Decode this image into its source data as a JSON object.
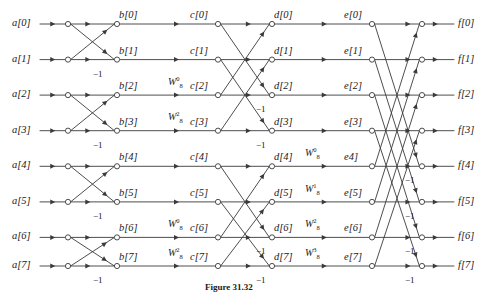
{
  "figure": {
    "caption": "Figure 31.32",
    "node_radius": 2.6,
    "colors": {
      "line": "#3a3a3a",
      "node_stroke": "#3a3a3a",
      "node_fill": "#ffffff",
      "text": "#1a1a1a",
      "background": "#ffffff"
    }
  },
  "columns": [
    {
      "key": "a",
      "x": 40,
      "label_x": 10,
      "kind": "input"
    },
    {
      "key": "n1",
      "x": 68,
      "label_x": null,
      "kind": "node"
    },
    {
      "key": "b",
      "x": 117,
      "label_x": 120,
      "kind": "node"
    },
    {
      "key": "c",
      "x": 218,
      "label_x": 190,
      "kind": "node"
    },
    {
      "key": "d",
      "x": 272,
      "label_x": 275,
      "kind": "node"
    },
    {
      "key": "e",
      "x": 372,
      "label_x": 344,
      "kind": "node"
    },
    {
      "key": "f",
      "x": 422,
      "label_x": 453,
      "kind": "output"
    }
  ],
  "rows": {
    "count": 8,
    "y": [
      24,
      59.6,
      95.1,
      130.7,
      166.3,
      201.9,
      237.4,
      266.0
    ]
  },
  "labels": {
    "a": [
      "a[0]",
      "a[1]",
      "a[2]",
      "a[3]",
      "a[4]",
      "a[5]",
      "a[6]",
      "a[7]"
    ],
    "b": [
      "b[0]",
      "b[1]",
      "b[2]",
      "b[3]",
      "b[4]",
      "b[5]",
      "b[6]",
      "b[7]"
    ],
    "c": [
      "c[0]",
      "c[1]",
      "c[2]",
      "c[3]",
      "c[4]",
      "c[5]",
      "c[6]",
      "c[7]"
    ],
    "d": [
      "d[0]",
      "d[1]",
      "d[2]",
      "d[3]",
      "d[4]",
      "d[5]",
      "d[6]",
      "d[7]"
    ],
    "e": [
      "e[0]",
      "e[1]",
      "e[2]",
      "e[3]",
      "e4]",
      "e[5]",
      "e[6]",
      "e[7]"
    ],
    "f": [
      "f[0]",
      "f[1]",
      "f[2]",
      "f[3]",
      "f[4]",
      "f[5]",
      "f[6]",
      "f[7]"
    ]
  },
  "minus_one_symbol": "−1",
  "minus_one_markers": [
    {
      "stage": "a-b",
      "row": 1,
      "x": 93,
      "y": 70
    },
    {
      "stage": "a-b",
      "row": 3,
      "x": 93,
      "y": 141
    },
    {
      "stage": "a-b",
      "row": 5,
      "x": 93,
      "y": 212
    },
    {
      "stage": "a-b",
      "row": 7,
      "x": 93,
      "y": 276
    },
    {
      "stage": "c-d",
      "row": 2,
      "x": 256,
      "y": 105
    },
    {
      "stage": "c-d",
      "row": 3,
      "x": 256,
      "y": 141
    },
    {
      "stage": "c-d",
      "row": 6,
      "x": 256,
      "y": 247
    },
    {
      "stage": "c-d",
      "row": 7,
      "x": 256,
      "y": 276
    },
    {
      "stage": "e-f",
      "row": 4,
      "x": 405,
      "y": 176
    },
    {
      "stage": "e-f",
      "row": 5,
      "x": 405,
      "y": 212
    },
    {
      "stage": "e-f",
      "row": 6,
      "x": 405,
      "y": 247
    },
    {
      "stage": "e-f",
      "row": 7,
      "x": 405,
      "y": 276
    }
  ],
  "twiddles": [
    {
      "stage": "b-c",
      "row": 2,
      "base": "W",
      "sub": "8",
      "sup": "0",
      "x": 168,
      "y": 76
    },
    {
      "stage": "b-c",
      "row": 3,
      "base": "W",
      "sub": "8",
      "sup": "2",
      "x": 168,
      "y": 111
    },
    {
      "stage": "b-c",
      "row": 6,
      "base": "W",
      "sub": "8",
      "sup": "0",
      "x": 168,
      "y": 218
    },
    {
      "stage": "b-c",
      "row": 7,
      "base": "W",
      "sub": "8",
      "sup": "2",
      "x": 168,
      "y": 247
    },
    {
      "stage": "d-e",
      "row": 4,
      "base": "W",
      "sub": "8",
      "sup": "0",
      "x": 305,
      "y": 147
    },
    {
      "stage": "d-e",
      "row": 5,
      "base": "W",
      "sub": "8",
      "sup": "1",
      "x": 305,
      "y": 183
    },
    {
      "stage": "d-e",
      "row": 6,
      "base": "W",
      "sub": "8",
      "sup": "2",
      "x": 305,
      "y": 218
    },
    {
      "stage": "d-e",
      "row": 7,
      "base": "W",
      "sub": "8",
      "sup": "3",
      "x": 305,
      "y": 247
    }
  ],
  "edges": {
    "input_to_n1": [
      [
        0,
        0
      ],
      [
        1,
        1
      ],
      [
        2,
        2
      ],
      [
        3,
        3
      ],
      [
        4,
        4
      ],
      [
        5,
        5
      ],
      [
        6,
        6
      ],
      [
        7,
        7
      ]
    ],
    "stage_ab_straight": [
      [
        0,
        0
      ],
      [
        1,
        1
      ],
      [
        2,
        2
      ],
      [
        3,
        3
      ],
      [
        4,
        4
      ],
      [
        5,
        5
      ],
      [
        6,
        6
      ],
      [
        7,
        7
      ]
    ],
    "stage_ab_cross": [
      [
        0,
        1
      ],
      [
        1,
        0
      ],
      [
        2,
        3
      ],
      [
        3,
        2
      ],
      [
        4,
        5
      ],
      [
        5,
        4
      ],
      [
        6,
        7
      ],
      [
        7,
        6
      ]
    ],
    "stage_bc_straight": [
      [
        0,
        0
      ],
      [
        1,
        1
      ],
      [
        2,
        2
      ],
      [
        3,
        3
      ],
      [
        4,
        4
      ],
      [
        5,
        5
      ],
      [
        6,
        6
      ],
      [
        7,
        7
      ]
    ],
    "stage_cd_straight": [
      [
        0,
        0
      ],
      [
        1,
        1
      ],
      [
        2,
        2
      ],
      [
        3,
        3
      ],
      [
        4,
        4
      ],
      [
        5,
        5
      ],
      [
        6,
        6
      ],
      [
        7,
        7
      ]
    ],
    "stage_cd_cross": [
      [
        0,
        2
      ],
      [
        2,
        0
      ],
      [
        1,
        3
      ],
      [
        3,
        1
      ],
      [
        4,
        6
      ],
      [
        6,
        4
      ],
      [
        5,
        7
      ],
      [
        7,
        5
      ]
    ],
    "stage_de_straight": [
      [
        0,
        0
      ],
      [
        1,
        1
      ],
      [
        2,
        2
      ],
      [
        3,
        3
      ],
      [
        4,
        4
      ],
      [
        5,
        5
      ],
      [
        6,
        6
      ],
      [
        7,
        7
      ]
    ],
    "stage_ef_straight": [
      [
        0,
        0
      ],
      [
        1,
        1
      ],
      [
        2,
        2
      ],
      [
        3,
        3
      ],
      [
        4,
        4
      ],
      [
        5,
        5
      ],
      [
        6,
        6
      ],
      [
        7,
        7
      ]
    ],
    "stage_ef_cross": [
      [
        0,
        4
      ],
      [
        4,
        0
      ],
      [
        1,
        5
      ],
      [
        5,
        1
      ],
      [
        2,
        6
      ],
      [
        6,
        2
      ],
      [
        3,
        7
      ],
      [
        7,
        3
      ]
    ],
    "f_to_output": [
      [
        0,
        0
      ],
      [
        1,
        1
      ],
      [
        2,
        2
      ],
      [
        3,
        3
      ],
      [
        4,
        4
      ],
      [
        5,
        5
      ],
      [
        6,
        6
      ],
      [
        7,
        7
      ]
    ]
  },
  "chart_data": {
    "type": "diagram",
    "stages": 3,
    "points": 8,
    "node_columns": [
      "a",
      "b",
      "c",
      "d",
      "e",
      "f"
    ],
    "twiddle_factors": [
      "W_8^0",
      "W_8^1",
      "W_8^2",
      "W_8^3"
    ],
    "sign_inversions": "−1"
  }
}
